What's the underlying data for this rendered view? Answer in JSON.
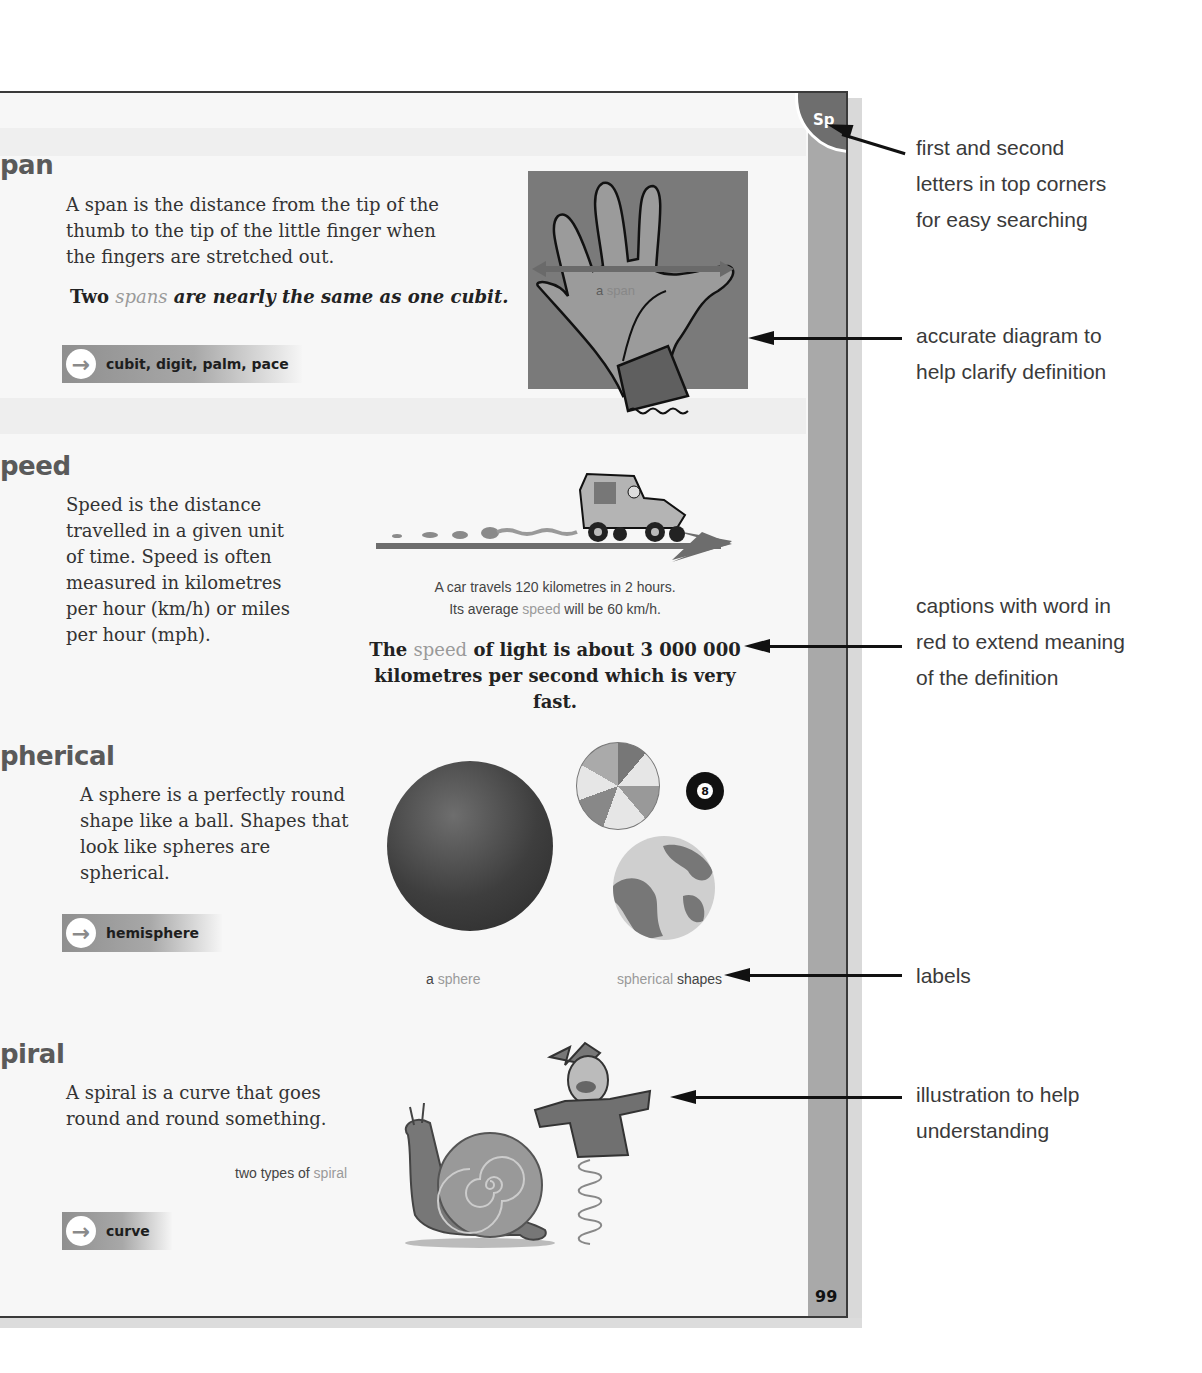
{
  "page": {
    "corner_letters": "Sp",
    "page_number": "99"
  },
  "entries": [
    {
      "term": "pan",
      "definition": [
        "A span is the distance from the tip of the",
        "thumb to the tip of the little finger when",
        "the fingers are stretched out."
      ],
      "example": {
        "pre": "Two ",
        "highlight": "spans",
        "post": " are nearly the same as one cubit."
      },
      "see_also": "cubit, digit, palm, pace",
      "diagram_label": {
        "pre": "a ",
        "highlight": "span"
      }
    },
    {
      "term": "peed",
      "definition": [
        "Speed is the distance",
        "travelled in a given unit",
        "of time. Speed is often",
        "measured in kilometres",
        "per hour (km/h) or miles",
        "per hour (mph)."
      ],
      "caption": {
        "line1": "A car travels 120 kilometres in 2 hours.",
        "line2_pre": "Its average ",
        "line2_highlight": "speed",
        "line2_post": " will be 60 km/h."
      },
      "example": {
        "pre": "The ",
        "highlight": "speed",
        "post1": " of light is about 3 000 000",
        "line2": "kilometres per second which is very fast."
      }
    },
    {
      "term": "pherical",
      "definition": [
        "A sphere is a perfectly round",
        "shape like a ball. Shapes that",
        "look like spheres are",
        "spherical."
      ],
      "see_also": "hemisphere",
      "label_left": {
        "pre": "a ",
        "highlight": "sphere"
      },
      "label_right": {
        "highlight": "spherical",
        "post": " shapes"
      },
      "ball_number": "8"
    },
    {
      "term": "piral",
      "definition": [
        "A spiral is a curve that goes",
        "round and round something."
      ],
      "caption": {
        "pre": "two types of ",
        "highlight": "spiral"
      },
      "see_also": "curve"
    }
  ],
  "annotations": [
    {
      "lines": [
        "first and second",
        "letters in top corners",
        "for easy searching"
      ]
    },
    {
      "lines": [
        "accurate diagram to",
        "help clarify definition"
      ]
    },
    {
      "lines": [
        "captions with word in",
        "red to extend meaning",
        "of the definition"
      ]
    },
    {
      "lines": [
        "labels"
      ]
    },
    {
      "lines": [
        "illustration to help",
        "understanding"
      ]
    }
  ],
  "icons": {
    "see_also_arrow": "→"
  }
}
